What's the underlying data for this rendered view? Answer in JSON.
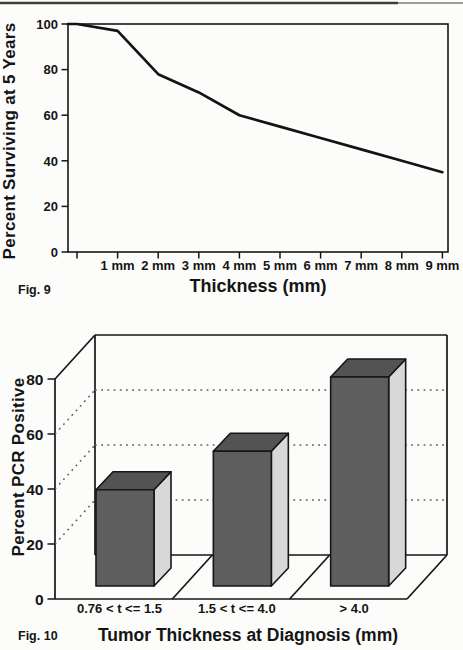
{
  "page": {
    "fig9_label": "Fig. 9",
    "fig10_label": "Fig. 10"
  },
  "chart_data": [
    {
      "id": "fig9",
      "type": "line",
      "title": "",
      "xlabel": "Thickness (mm)",
      "ylabel": "Percent Surviving at 5 Years",
      "x": [
        0,
        1,
        2,
        3,
        4,
        5,
        6,
        7,
        8,
        9
      ],
      "x_tick_labels": [
        "1 mm",
        "2 mm",
        "3 mm",
        "4 mm",
        "5 mm",
        "6 mm",
        "7 mm",
        "8 mm",
        "9 mm"
      ],
      "values": [
        100,
        97,
        78,
        70,
        60,
        55,
        50,
        45,
        40,
        35
      ],
      "yticks": [
        0,
        20,
        40,
        60,
        80,
        100
      ],
      "ylim": [
        0,
        100
      ],
      "grid": false,
      "box": true,
      "line_color": "#131313"
    },
    {
      "id": "fig10",
      "type": "bar",
      "style": "3d-perspective",
      "title": "",
      "xlabel": "Tumor Thickness at Diagnosis (mm)",
      "ylabel": "Percent PCR Positive",
      "categories": [
        "0.76 < t <= 1.5",
        "1.5 < t <= 4.0",
        "> 4.0"
      ],
      "values": [
        35,
        49,
        76
      ],
      "yticks": [
        0,
        20,
        40,
        60,
        80
      ],
      "grid_values": [
        20,
        40,
        60
      ],
      "ylim": [
        0,
        80
      ],
      "grid": "dotted horizontal gridlines on back wall",
      "legend": "none",
      "bar_front_color": "#5e5e5e",
      "bar_top_color": "#535353",
      "bar_side_color": "#d8d8d8",
      "outline_color": "#161616"
    }
  ]
}
